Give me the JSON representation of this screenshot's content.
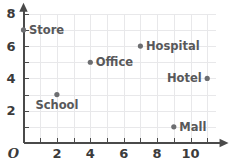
{
  "chart_data": {
    "type": "scatter",
    "title": "",
    "xlabel": "",
    "ylabel": "",
    "xlim": [
      0,
      11.5
    ],
    "ylim": [
      0,
      8.3
    ],
    "grid": true,
    "grid_step": 1,
    "legend": "none",
    "origin_label": "O",
    "x_ticks_major": [
      2,
      4,
      6,
      8,
      10
    ],
    "x_tick_labels": [
      "2",
      "4",
      "6",
      "8",
      "10"
    ],
    "x_ticks_minor": [
      1,
      3,
      5,
      7,
      9,
      11
    ],
    "y_ticks_major": [
      2,
      4,
      6,
      8
    ],
    "y_tick_labels": [
      "2",
      "4",
      "6",
      "8"
    ],
    "y_ticks_minor": [
      1,
      3,
      5,
      7
    ],
    "points": [
      {
        "label": "Store",
        "x": 0,
        "y": 7,
        "label_pos": "right"
      },
      {
        "label": "Hospital",
        "x": 7,
        "y": 6,
        "label_pos": "right"
      },
      {
        "label": "Office",
        "x": 4,
        "y": 5,
        "label_pos": "right"
      },
      {
        "label": "Hotel",
        "x": 11,
        "y": 4,
        "label_pos": "left"
      },
      {
        "label": "School",
        "x": 2,
        "y": 3,
        "label_pos": "below"
      },
      {
        "label": "Mall",
        "x": 9,
        "y": 1,
        "label_pos": "right"
      }
    ],
    "colors": {
      "point": "#6d6e71",
      "grid": "#e8e8ea",
      "axis": "#4a4a4a",
      "tick_label": "#3b3b3b",
      "point_label": "#58585a",
      "background": "#ffffff"
    }
  }
}
